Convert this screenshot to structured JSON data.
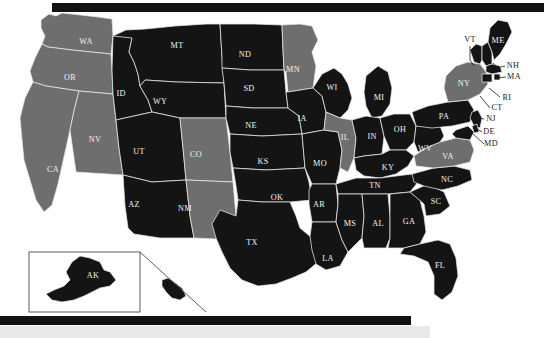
{
  "image": {
    "kind": "choropleth-map",
    "subject": "United States state map, two-tone shading",
    "width": 544,
    "height": 338,
    "background_color": "#ffffff"
  },
  "legend_colors": {
    "dark_fill": "#141414",
    "light_fill": "#6e6e6e",
    "border_stroke": "#e8e8e8",
    "label_text": "#f2f2f2",
    "outside_label_text": "#1a1a1a",
    "bar_color": "#121212",
    "strip_color": "#e9e9e9"
  },
  "decorations": {
    "top_bar": {
      "name": "top-black-bar",
      "x": 52,
      "y": 3,
      "w": 492,
      "h": 9
    },
    "bottom_bar": {
      "name": "bottom-black-bar",
      "x": 0,
      "y": 316,
      "w": 411,
      "h": 9
    },
    "bottom_strip": {
      "name": "bottom-gray-strip",
      "x": 0,
      "y": 326,
      "w": 430,
      "h": 12
    }
  },
  "inset": {
    "name": "alaska-hawaii-inset",
    "box": {
      "x": 29,
      "y": 252,
      "w": 111,
      "h": 60
    },
    "diagonal_divider": true,
    "members": [
      "AK",
      "HI"
    ]
  },
  "states": [
    {
      "code": "WA",
      "name": "Washington",
      "shade": "light",
      "label_x": 86,
      "label_y": 42
    },
    {
      "code": "OR",
      "name": "Oregon",
      "shade": "light",
      "label_x": 70,
      "label_y": 78
    },
    {
      "code": "ID",
      "name": "Idaho",
      "shade": "dark",
      "label_x": 121,
      "label_y": 94
    },
    {
      "code": "MT",
      "name": "Montana",
      "shade": "dark",
      "label_x": 177,
      "label_y": 46
    },
    {
      "code": "ND",
      "name": "North Dakota",
      "shade": "dark",
      "label_x": 245,
      "label_y": 55
    },
    {
      "code": "SD",
      "name": "South Dakota",
      "shade": "dark",
      "label_x": 249,
      "label_y": 89
    },
    {
      "code": "WY",
      "name": "Wyoming",
      "shade": "dark",
      "label_x": 160,
      "label_y": 102
    },
    {
      "code": "NE",
      "name": "Nebraska",
      "shade": "dark",
      "label_x": 251,
      "label_y": 126
    },
    {
      "code": "IA",
      "name": "Iowa",
      "shade": "dark",
      "label_x": 302,
      "label_y": 119
    },
    {
      "code": "MN",
      "name": "Minnesota",
      "shade": "light",
      "label_x": 293,
      "label_y": 70
    },
    {
      "code": "WI",
      "name": "Wisconsin",
      "shade": "dark",
      "label_x": 332,
      "label_y": 88
    },
    {
      "code": "MI",
      "name": "Michigan",
      "shade": "dark",
      "label_x": 379,
      "label_y": 98
    },
    {
      "code": "NV",
      "name": "Nevada",
      "shade": "light",
      "label_x": 95,
      "label_y": 140
    },
    {
      "code": "UT",
      "name": "Utah",
      "shade": "dark",
      "label_x": 139,
      "label_y": 152
    },
    {
      "code": "CO",
      "name": "Colorado",
      "shade": "light",
      "label_x": 196,
      "label_y": 155
    },
    {
      "code": "KS",
      "name": "Kansas",
      "shade": "dark",
      "label_x": 263,
      "label_y": 162
    },
    {
      "code": "MO",
      "name": "Missouri",
      "shade": "dark",
      "label_x": 320,
      "label_y": 164
    },
    {
      "code": "IL",
      "name": "Illinois",
      "shade": "light",
      "label_x": 345,
      "label_y": 138
    },
    {
      "code": "IN",
      "name": "Indiana",
      "shade": "dark",
      "label_x": 372,
      "label_y": 137
    },
    {
      "code": "OH",
      "name": "Ohio",
      "shade": "dark",
      "label_x": 400,
      "label_y": 130
    },
    {
      "code": "PA",
      "name": "Pennsylvania",
      "shade": "dark",
      "label_x": 444,
      "label_y": 117
    },
    {
      "code": "NY",
      "name": "New York",
      "shade": "light",
      "label_x": 464,
      "label_y": 84
    },
    {
      "code": "CA",
      "name": "California",
      "shade": "light",
      "label_x": 53,
      "label_y": 170
    },
    {
      "code": "AZ",
      "name": "Arizona",
      "shade": "dark",
      "label_x": 134,
      "label_y": 205
    },
    {
      "code": "NM",
      "name": "New Mexico",
      "shade": "light",
      "label_x": 185,
      "label_y": 209
    },
    {
      "code": "OK",
      "name": "Oklahoma",
      "shade": "dark",
      "label_x": 277,
      "label_y": 198
    },
    {
      "code": "AR",
      "name": "Arkansas",
      "shade": "dark",
      "label_x": 319,
      "label_y": 205
    },
    {
      "code": "TX",
      "name": "Texas",
      "shade": "dark",
      "label_x": 252,
      "label_y": 243
    },
    {
      "code": "LA",
      "name": "Louisiana",
      "shade": "dark",
      "label_x": 328,
      "label_y": 259
    },
    {
      "code": "MS",
      "name": "Mississippi",
      "shade": "dark",
      "label_x": 350,
      "label_y": 224
    },
    {
      "code": "AL",
      "name": "Alabama",
      "shade": "dark",
      "label_x": 378,
      "label_y": 224
    },
    {
      "code": "GA",
      "name": "Georgia",
      "shade": "dark",
      "label_x": 409,
      "label_y": 222
    },
    {
      "code": "TN",
      "name": "Tennessee",
      "shade": "dark",
      "label_x": 375,
      "label_y": 186
    },
    {
      "code": "KY",
      "name": "Kentucky",
      "shade": "dark",
      "label_x": 388,
      "label_y": 168
    },
    {
      "code": "WV",
      "name": "West Virginia",
      "shade": "dark",
      "label_x": 425,
      "label_y": 149
    },
    {
      "code": "VA",
      "name": "Virginia",
      "shade": "light",
      "label_x": 448,
      "label_y": 157
    },
    {
      "code": "NC",
      "name": "North Carolina",
      "shade": "dark",
      "label_x": 447,
      "label_y": 180
    },
    {
      "code": "SC",
      "name": "South Carolina",
      "shade": "dark",
      "label_x": 436,
      "label_y": 202
    },
    {
      "code": "FL",
      "name": "Florida",
      "shade": "dark",
      "label_x": 440,
      "label_y": 266
    },
    {
      "code": "ME",
      "name": "Maine",
      "shade": "dark",
      "label_x": 498,
      "label_y": 41
    },
    {
      "code": "VT",
      "name": "Vermont",
      "shade": "dark",
      "label_x": 470,
      "label_y": 40
    },
    {
      "code": "NH",
      "name": "New Hampshire",
      "shade": "dark",
      "label_x": 513,
      "label_y": 66
    },
    {
      "code": "MA",
      "name": "Massachusetts",
      "shade": "dark",
      "label_x": 514,
      "label_y": 77
    },
    {
      "code": "RI",
      "name": "Rhode Island",
      "shade": "dark",
      "label_x": 507,
      "label_y": 98
    },
    {
      "code": "CT",
      "name": "Connecticut",
      "shade": "dark",
      "label_x": 497,
      "label_y": 108
    },
    {
      "code": "NJ",
      "name": "New Jersey",
      "shade": "dark",
      "label_x": 491,
      "label_y": 119
    },
    {
      "code": "DE",
      "name": "Delaware",
      "shade": "dark",
      "label_x": 489,
      "label_y": 132
    },
    {
      "code": "MD",
      "name": "Maryland",
      "shade": "dark",
      "label_x": 491,
      "label_y": 144
    },
    {
      "code": "AK",
      "name": "Alaska",
      "shade": "dark",
      "label_x": 93,
      "label_y": 276
    },
    {
      "code": "HI",
      "name": "Hawaii",
      "shade": "dark",
      "label_x": 172,
      "label_y": 292
    }
  ],
  "leader_lines": [
    {
      "for": "VT",
      "points": "470,46 470,60 474,66"
    },
    {
      "for": "NH",
      "points": "505,66 497,68 493,63"
    },
    {
      "for": "MA",
      "points": "506,77 496,78"
    },
    {
      "for": "RI",
      "points": "500,97 489,88"
    },
    {
      "for": "CT",
      "points": "490,108 480,96"
    },
    {
      "for": "NJ",
      "points": "484,119 477,118"
    },
    {
      "for": "DE",
      "points": "482,132 474,127"
    },
    {
      "for": "MD",
      "points": "484,144 472,133"
    }
  ]
}
